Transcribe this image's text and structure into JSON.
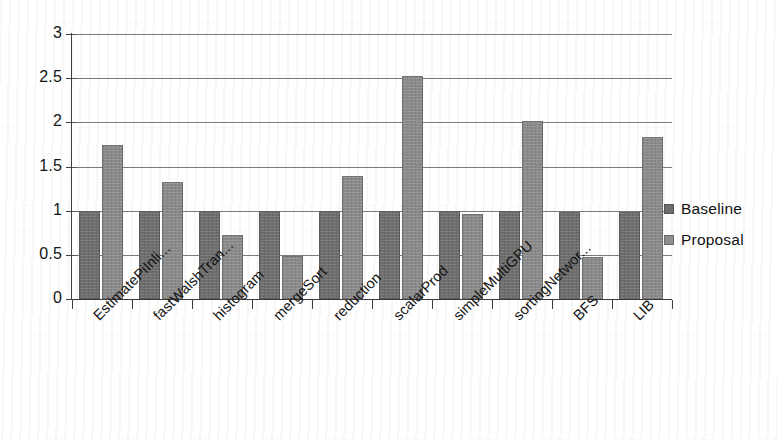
{
  "chart_data": {
    "type": "bar",
    "title": "",
    "subtitle": "",
    "xlabel": "",
    "ylabel": "",
    "ylim": [
      0,
      3
    ],
    "yticks": [
      "0",
      "0.5",
      "1",
      "1.5",
      "2",
      "2.5",
      "3"
    ],
    "ytick_values": [
      0,
      0.5,
      1,
      1.5,
      2,
      2.5,
      3
    ],
    "grid": true,
    "legend_position": "right",
    "categories": [
      "EstimatePiInli...",
      "fastWalshTran...",
      "histogram",
      "mergeSort",
      "reduction",
      "scalarProd",
      "simpleMultiGPU",
      "sortingNetwor...",
      "BFS",
      "LIB"
    ],
    "series": [
      {
        "name": "Baseline",
        "color": "#6e6e6e",
        "values": [
          1.0,
          1.0,
          1.0,
          1.0,
          1.0,
          1.0,
          1.0,
          1.0,
          0.99,
          0.98
        ]
      },
      {
        "name": "Proposal",
        "color": "#8f8f8f",
        "values": [
          1.74,
          1.33,
          0.72,
          0.49,
          1.39,
          2.52,
          0.96,
          2.02,
          0.48,
          1.83
        ]
      }
    ]
  },
  "legend": {
    "items": [
      {
        "label": "Baseline"
      },
      {
        "label": "Proposal"
      }
    ]
  }
}
